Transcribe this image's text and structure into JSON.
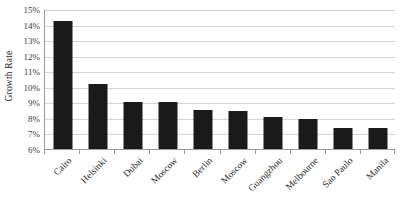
{
  "chart_data": {
    "type": "bar",
    "title": "",
    "subtitle": "",
    "xlabel": "",
    "ylabel": "Growth Rate",
    "ylim": [
      6,
      15
    ],
    "ytick_labels": [
      "15%",
      "14%",
      "13%",
      "12%",
      "11%",
      "10%",
      "9%",
      "8%",
      "7%",
      "6%"
    ],
    "ytick_values": [
      15,
      14,
      13,
      12,
      11,
      10,
      9,
      8,
      7,
      6
    ],
    "grid": true,
    "legend": false,
    "legend_position": "none",
    "value_suffix": "%",
    "bar_color": "#1a1a1a",
    "gridline_color": "#d4d4d4",
    "axis_color": "#9a9a9a",
    "categories": [
      "Cairo",
      "Helsinki",
      "Dubai",
      "Moscow",
      "Berlin",
      "Moscow",
      "Guangzhou",
      "Melbourne",
      "Sao Paulo",
      "Manila"
    ],
    "values": [
      14.2,
      10.2,
      9.0,
      9.0,
      8.5,
      8.45,
      8.05,
      7.9,
      7.35,
      7.35
    ]
  }
}
